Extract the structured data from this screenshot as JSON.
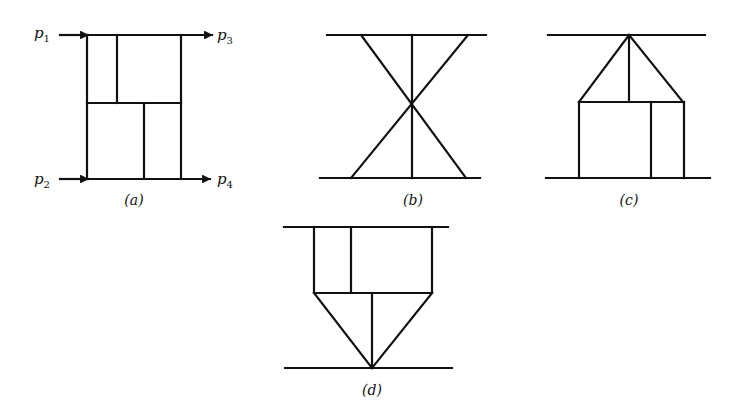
{
  "figure": {
    "panels": [
      {
        "id": "a",
        "caption": "(a)",
        "labels": {
          "p1": "p",
          "p1_sub": "1",
          "p2": "p",
          "p2_sub": "2",
          "p3": "p",
          "p3_sub": "3",
          "p4": "p",
          "p4_sub": "4"
        }
      },
      {
        "id": "b",
        "caption": "(b)"
      },
      {
        "id": "c",
        "caption": "(c)"
      },
      {
        "id": "d",
        "caption": "(d)"
      }
    ],
    "colors": {
      "line": "#111111",
      "background": "#ffffff"
    }
  }
}
